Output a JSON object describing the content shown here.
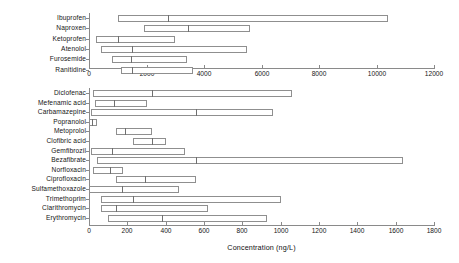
{
  "figure": {
    "background": "#ffffff",
    "line_color": "#8a8a8a",
    "box_fill": "#ffffff",
    "box_edge": "#8f8f8f",
    "median_color": "#6f6f6f",
    "text_color": "#151515"
  },
  "axis_title": "Concentration (ng/L)",
  "chart_data": [
    {
      "type": "box",
      "panel": "top",
      "title": "",
      "xlabel": "",
      "ylabel": "",
      "orientation": "horizontal",
      "xlim": [
        0,
        12000
      ],
      "xticks": [
        0,
        2000,
        4000,
        6000,
        8000,
        10000,
        12000
      ],
      "xticklabels": [
        "0",
        "2000",
        "4000",
        "6000",
        "8000",
        "10000",
        "12000"
      ],
      "grid": false,
      "legend": "none",
      "categories": [
        "Ibuprofen",
        "Naproxen",
        "Ketoprofen",
        "Atenolol",
        "Furosemide",
        "Ranitidine"
      ],
      "boxes": [
        {
          "label": "Ibuprofen",
          "min": 1000,
          "q1": 1000,
          "median": 2750,
          "q3": 10400,
          "max": 10400
        },
        {
          "label": "Naproxen",
          "min": 1900,
          "q1": 1900,
          "median": 3450,
          "q3": 5600,
          "max": 5600
        },
        {
          "label": "Ketoprofen",
          "min": 250,
          "q1": 250,
          "median": 1000,
          "q3": 3000,
          "max": 3000
        },
        {
          "label": "Atenolol",
          "min": 400,
          "q1": 400,
          "median": 1500,
          "q3": 5500,
          "max": 5500
        },
        {
          "label": "Furosemide",
          "min": 800,
          "q1": 800,
          "median": 1450,
          "q3": 3400,
          "max": 3400
        },
        {
          "label": "Ranitidine",
          "min": 1100,
          "q1": 1100,
          "median": 1500,
          "q3": 3600,
          "max": 3600
        }
      ]
    },
    {
      "type": "box",
      "panel": "bottom",
      "title": "",
      "xlabel": "Concentration (ng/L)",
      "ylabel": "",
      "orientation": "horizontal",
      "xlim": [
        0,
        1800
      ],
      "xticks": [
        0,
        200,
        400,
        600,
        800,
        1000,
        1200,
        1400,
        1600,
        1800
      ],
      "xticklabels": [
        "0",
        "200",
        "400",
        "600",
        "800",
        "1000",
        "1200",
        "1400",
        "1600",
        "1800"
      ],
      "grid": false,
      "legend": "none",
      "categories": [
        "Diclofenac",
        "Mefenamic acid",
        "Carbamazepine",
        "Popranolol",
        "Metoprolol",
        "Clofibric acid",
        "Gemfibrozil",
        "Bezafibrate",
        "Norfloxacin",
        "Ciprofloxacin",
        "Sulfamethoxazole",
        "Trimethoprim",
        "Clarithromycin",
        "Erythromycin"
      ],
      "boxes": [
        {
          "label": "Diclofenac",
          "min": 20,
          "q1": 20,
          "median": 330,
          "q3": 1060,
          "max": 1060
        },
        {
          "label": "Mefenamic acid",
          "min": 30,
          "q1": 30,
          "median": 130,
          "q3": 300,
          "max": 300
        },
        {
          "label": "Carbamazepine",
          "min": 10,
          "q1": 10,
          "median": 560,
          "q3": 960,
          "max": 960
        },
        {
          "label": "Popranolol",
          "min": 0,
          "q1": 0,
          "median": 18,
          "q3": 42,
          "max": 42
        },
        {
          "label": "Metoprolol",
          "min": 140,
          "q1": 140,
          "median": 190,
          "q3": 330,
          "max": 330
        },
        {
          "label": "Clofibric acid",
          "min": 230,
          "q1": 230,
          "median": 330,
          "q3": 400,
          "max": 400
        },
        {
          "label": "Gemfibrozil",
          "min": 10,
          "q1": 10,
          "median": 120,
          "q3": 500,
          "max": 500
        },
        {
          "label": "Bezafibrate",
          "min": 40,
          "q1": 40,
          "median": 560,
          "q3": 1640,
          "max": 1640
        },
        {
          "label": "Norfloxacin",
          "min": 20,
          "q1": 20,
          "median": 110,
          "q3": 180,
          "max": 180
        },
        {
          "label": "Ciprofloxacin",
          "min": 140,
          "q1": 140,
          "median": 290,
          "q3": 560,
          "max": 560
        },
        {
          "label": "Sulfamethoxazole",
          "min": 0,
          "q1": 0,
          "median": 170,
          "q3": 470,
          "max": 470
        },
        {
          "label": "Trimethoprim",
          "min": 60,
          "q1": 60,
          "median": 230,
          "q3": 1000,
          "max": 1000
        },
        {
          "label": "Clarithromycin",
          "min": 60,
          "q1": 60,
          "median": 140,
          "q3": 620,
          "max": 620
        },
        {
          "label": "Erythromycin",
          "min": 100,
          "q1": 100,
          "median": 380,
          "q3": 930,
          "max": 930
        }
      ]
    }
  ]
}
